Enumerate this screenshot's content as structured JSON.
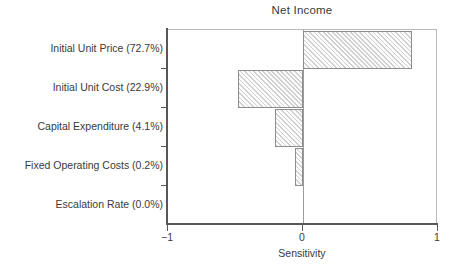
{
  "chart_data": {
    "type": "bar",
    "orientation": "horizontal",
    "title": "Net Income",
    "xlabel": "Sensitivity",
    "ylabel": "",
    "xlim": [
      -1,
      1
    ],
    "xticks": [
      -1,
      0,
      1
    ],
    "xticklabels": [
      "−1",
      "0",
      "1"
    ],
    "grid": false,
    "legend": null,
    "zero_reference_line": 0,
    "categories": [
      "Initial Unit Price (72.7%)",
      "Initial Unit Cost (22.9%)",
      "Capital Expenditure (4.1%)",
      "Fixed Operating Costs (0.2%)",
      "Escalation Rate (0.0%)"
    ],
    "values": [
      0.81,
      -0.48,
      -0.21,
      -0.06,
      0.0
    ],
    "bars": [
      {
        "label": "Initial Unit Price (72.7%)",
        "value": 0.81,
        "percent": "72.7%"
      },
      {
        "label": "Initial Unit Cost (22.9%)",
        "value": -0.48,
        "percent": "22.9%"
      },
      {
        "label": "Capital Expenditure (4.1%)",
        "value": -0.21,
        "percent": "4.1%"
      },
      {
        "label": "Fixed Operating Costs (0.2%)",
        "value": -0.06,
        "percent": "0.2%"
      },
      {
        "label": "Escalation Rate (0.0%)",
        "value": 0.0,
        "percent": "0.0%"
      }
    ],
    "colors": {
      "bar_fill": "#cfcfcf",
      "bar_edge": "#8d8d8d",
      "bar_hatch": "diagonal-45",
      "axis": "#575757",
      "frame": "#b9b9b9",
      "zero_line": "#9a9a9a",
      "text": "#3a3a3a",
      "background": "#ffffff"
    }
  }
}
